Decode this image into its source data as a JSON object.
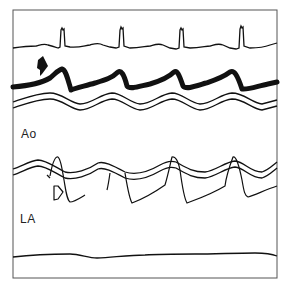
{
  "figure": {
    "type": "M-mode echocardiogram tracing",
    "labels": {
      "aorta": "Ao",
      "left_atrium": "LA"
    },
    "markers": {
      "solid_arrow": "solid arrow pointing at thickened trace (upper)",
      "open_arrow": "open arrow pointing at left atrial wall motion"
    },
    "traces": [
      "ECG",
      "thick anterior wall trace",
      "aortic root (double line)",
      "posterior aortic wall (double line)",
      "left atrial motion",
      "baseline"
    ],
    "beats": 4,
    "colors": {
      "ink": "#111111",
      "frame": "#555555",
      "background": "#ffffff"
    }
  }
}
